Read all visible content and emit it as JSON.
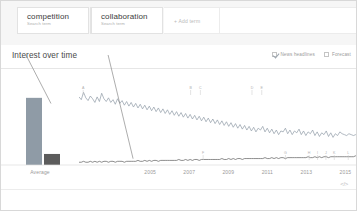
{
  "search_terms": [
    {
      "title": "competition",
      "subtitle": "Search term",
      "color": "#8f9ba6"
    },
    {
      "title": "collaboration",
      "subtitle": "Search term",
      "color": "#5c5c5c"
    }
  ],
  "add_term_label": "+ Add term",
  "section": {
    "title": "Interest over time"
  },
  "toggles": [
    {
      "label": "News headlines",
      "checked": true
    },
    {
      "label": "Forecast",
      "checked": false
    }
  ],
  "average_panel": {
    "axis_label": "Average"
  },
  "footer": {
    "embed_icon": "</>"
  },
  "chart_data": {
    "type": "line",
    "title": "Interest over time",
    "xlabel": "",
    "ylabel": "",
    "ylim": [
      0,
      100
    ],
    "grid": false,
    "legend": "none",
    "x_tick_labels": [
      "2005",
      "2007",
      "2009",
      "2011",
      "2013",
      "2015"
    ],
    "x_tick_positions_pct": [
      25.5,
      39.5,
      53.5,
      67.5,
      81.5,
      95.5
    ],
    "series": [
      {
        "name": "competition",
        "color": "#8f9ba6",
        "average": 73,
        "values": [
          74,
          71,
          79,
          73,
          70,
          75,
          72,
          68,
          74,
          69,
          78,
          72,
          69,
          73,
          68,
          71,
          66,
          72,
          67,
          70,
          65,
          69,
          64,
          68,
          63,
          67,
          62,
          66,
          61,
          65,
          60,
          64,
          59,
          63,
          58,
          62,
          57,
          61,
          56,
          60,
          55,
          59,
          54,
          58,
          53,
          57,
          52,
          56,
          51,
          55,
          50,
          54,
          49,
          53,
          48,
          52,
          47,
          51,
          46,
          50,
          45,
          49,
          44,
          48,
          43,
          47,
          42,
          46,
          41,
          45,
          40,
          44,
          39,
          43,
          38,
          42,
          37,
          41,
          36,
          40,
          38,
          42,
          36,
          40,
          35,
          39,
          34,
          38,
          33,
          37,
          36,
          40,
          34,
          38,
          33,
          37,
          35,
          39,
          33,
          37,
          32,
          36,
          34,
          38,
          32,
          36,
          31,
          35,
          33,
          37,
          31,
          35,
          30,
          34,
          32,
          36,
          34,
          33,
          32,
          34,
          33,
          32,
          33,
          32
        ]
      },
      {
        "name": "collaboration",
        "color": "#5c5c5c",
        "average": 12,
        "values": [
          3,
          3,
          4,
          3,
          3,
          4,
          3,
          4,
          3,
          4,
          3,
          4,
          4,
          3,
          4,
          4,
          3,
          4,
          4,
          4,
          3,
          4,
          4,
          4,
          4,
          4,
          5,
          4,
          4,
          5,
          4,
          5,
          4,
          5,
          5,
          4,
          5,
          5,
          5,
          5,
          5,
          5,
          5,
          5,
          6,
          5,
          5,
          6,
          5,
          6,
          5,
          6,
          6,
          5,
          6,
          6,
          6,
          6,
          6,
          6,
          6,
          6,
          6,
          7,
          6,
          6,
          7,
          6,
          7,
          6,
          7,
          7,
          6,
          7,
          7,
          7,
          7,
          7,
          7,
          7,
          7,
          7,
          8,
          7,
          7,
          8,
          7,
          8,
          7,
          8,
          8,
          7,
          8,
          8,
          8,
          8,
          8,
          8,
          8,
          8,
          8,
          9,
          8,
          8,
          9,
          8,
          9,
          8,
          9,
          9,
          8,
          9,
          9,
          9,
          9,
          9,
          9,
          9,
          9,
          9,
          9,
          9,
          10,
          9
        ]
      }
    ],
    "news_markers_top": [
      {
        "label": "A",
        "x_pct": 1.5
      },
      {
        "label": "B",
        "x_pct": 40.0
      },
      {
        "label": "C",
        "x_pct": 43.5
      },
      {
        "label": "D",
        "x_pct": 62.0
      },
      {
        "label": "E",
        "x_pct": 65.5
      }
    ],
    "news_markers_bottom": [
      {
        "label": "F",
        "x_pct": 44.5
      },
      {
        "label": "G",
        "x_pct": 74.0
      },
      {
        "label": "H",
        "x_pct": 82.5
      },
      {
        "label": "I",
        "x_pct": 85.5
      },
      {
        "label": "J",
        "x_pct": 88.5
      },
      {
        "label": "K",
        "x_pct": 91.5
      },
      {
        "label": "L",
        "x_pct": 96.5
      }
    ],
    "callouts": [
      {
        "from_term": "competition",
        "x1_pct": 7,
        "y1_pct": 0,
        "x2_pct": 14,
        "y2_pct": 30
      },
      {
        "from_term": "collaboration",
        "x1_pct": 30,
        "y1_pct": 0,
        "x2_pct": 37,
        "y2_pct": 78
      }
    ]
  }
}
